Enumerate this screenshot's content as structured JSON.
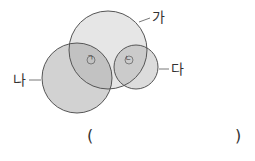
{
  "diagram": {
    "circles": [
      {
        "id": "ga",
        "label": "가",
        "cx": 108,
        "cy": 50,
        "r": 39
      },
      {
        "id": "na",
        "label": "나",
        "cx": 77,
        "cy": 78,
        "r": 35
      },
      {
        "id": "da",
        "label": "다",
        "cx": 136,
        "cy": 67,
        "r": 22
      }
    ],
    "markers": [
      {
        "id": "giyeok",
        "label": "ㄱ",
        "x": 88,
        "y": 60
      },
      {
        "id": "nieun",
        "label": "ㄴ",
        "x": 128,
        "y": 61
      }
    ],
    "answer": {
      "open": "(",
      "close": ")"
    },
    "colors": {
      "fill": "#d9d9d9",
      "overlap": "#c4c4c4",
      "stroke": "#555555"
    }
  }
}
